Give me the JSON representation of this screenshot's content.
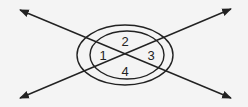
{
  "diagram": {
    "background": "#f4f4f4",
    "stroke": "#222222",
    "labels": [
      {
        "id": "1",
        "text": "1",
        "x": 103,
        "y": 60
      },
      {
        "id": "2",
        "text": "2",
        "x": 125,
        "y": 46
      },
      {
        "id": "3",
        "text": "3",
        "x": 151,
        "y": 60
      },
      {
        "id": "4",
        "text": "4",
        "x": 125,
        "y": 76
      }
    ],
    "lines": [
      {
        "name": "line-a",
        "x1": 20,
        "y1": 10,
        "x2": 231,
        "y2": 98
      },
      {
        "name": "line-b",
        "x1": 20,
        "y1": 98,
        "x2": 231,
        "y2": 9
      }
    ],
    "ellipses": [
      {
        "name": "outer-ellipse",
        "cx": 125,
        "cy": 55,
        "rx": 48,
        "ry": 30
      },
      {
        "name": "inner-ellipse",
        "cx": 127,
        "cy": 55,
        "rx": 37,
        "ry": 24
      }
    ]
  }
}
